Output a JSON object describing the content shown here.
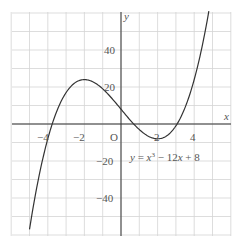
{
  "chart_data": {
    "type": "line",
    "title": "",
    "equation": "y = x³ − 12x + 8",
    "xlabel": "x",
    "ylabel": "y",
    "origin_label": "O",
    "xlim": [
      -6,
      6
    ],
    "ylim": [
      -60,
      60
    ],
    "grid": true,
    "x_grid_step": 1,
    "y_grid_step": 10,
    "x_ticks": [
      {
        "value": -4,
        "label": "−4"
      },
      {
        "value": -2,
        "label": "−2"
      },
      {
        "value": 2,
        "label": "2"
      },
      {
        "value": 4,
        "label": "4"
      }
    ],
    "y_ticks": [
      {
        "value": 40,
        "label": "40"
      },
      {
        "value": 20,
        "label": "20"
      },
      {
        "value": -20,
        "label": "−20"
      },
      {
        "value": -40,
        "label": "−40"
      }
    ],
    "series": [
      {
        "name": "y = x³ − 12x + 8",
        "x": [
          -5,
          -4.5,
          -4,
          -3.5,
          -3,
          -2.5,
          -2,
          -1.5,
          -1,
          -0.5,
          0,
          0.5,
          1,
          1.5,
          2,
          2.5,
          3,
          3.5,
          4,
          4.5,
          4.8
        ],
        "y": [
          -57,
          -29.1,
          -8,
          7.1,
          17,
          22.4,
          24,
          22.6,
          19,
          13.9,
          8,
          2.1,
          -3,
          -6.6,
          -8,
          -6.4,
          -1,
          8.9,
          24,
          45.1,
          61
        ]
      }
    ],
    "key_points": {
      "local_max": {
        "x": -2,
        "y": 24
      },
      "local_min": {
        "x": 2,
        "y": -8
      },
      "y_intercept": {
        "x": 0,
        "y": 8
      }
    }
  }
}
